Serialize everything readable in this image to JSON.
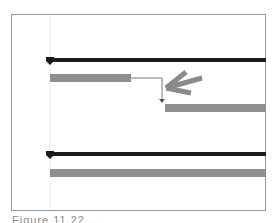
{
  "figure": {
    "caption": "Figure 11.22 ...",
    "colors": {
      "summary_bar": "#1a1a1a",
      "task_bar": "#8f8f8f",
      "connector": "#7a7a7a",
      "callout_arrow": "#8a8a8a",
      "frame": "#9a9a9a",
      "today_line": "#ececec"
    }
  },
  "gantt": {
    "groups": [
      {
        "name": "summary-1",
        "summary": {
          "start": 0,
          "end": 1.0
        },
        "tasks": [
          {
            "name": "task-1",
            "start": 0,
            "end": 0.38
          },
          {
            "name": "task-2",
            "start": 0.53,
            "end": 1.0,
            "predecessor": "task-1",
            "link": "finish-to-start"
          }
        ]
      },
      {
        "name": "summary-2",
        "summary": {
          "start": 0,
          "end": 1.0
        },
        "tasks": [
          {
            "name": "task-3",
            "start": 0,
            "end": 1.0
          }
        ]
      }
    ],
    "callout": {
      "type": "arrow",
      "points_to": "task-1 to task-2 dependency link"
    }
  }
}
